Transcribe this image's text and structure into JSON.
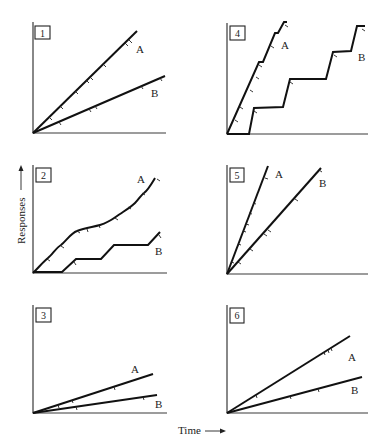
{
  "figure": {
    "y_axis_label": "Responses",
    "x_axis_label": "Time",
    "panels": [
      {
        "id": "1",
        "label": "1",
        "curve_a_label": "A",
        "curve_b_label": "B"
      },
      {
        "id": "2",
        "label": "2",
        "curve_a_label": "A",
        "curve_b_label": "B"
      },
      {
        "id": "3",
        "label": "3",
        "curve_a_label": "A",
        "curve_b_label": "B"
      },
      {
        "id": "4",
        "label": "4",
        "curve_a_label": "A",
        "curve_b_label": "B"
      },
      {
        "id": "5",
        "label": "5",
        "curve_a_label": "A",
        "curve_b_label": "B"
      },
      {
        "id": "6",
        "label": "6",
        "curve_a_label": "A",
        "curve_b_label": "B"
      }
    ]
  }
}
